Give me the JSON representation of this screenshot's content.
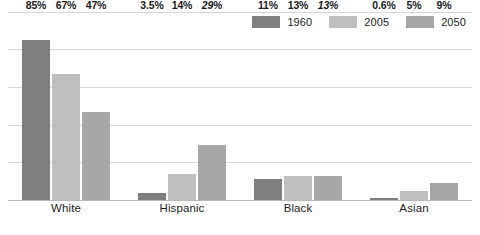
{
  "chart_data": {
    "type": "bar",
    "title": "",
    "subtitle": "",
    "xlabel": "",
    "ylabel": "",
    "ylim": [
      0,
      100
    ],
    "grid": true,
    "gridlines": [
      0,
      20,
      40,
      60,
      80,
      100
    ],
    "legend_position": "top-right",
    "categories": [
      "White",
      "Hispanic",
      "Black",
      "Asian"
    ],
    "series": [
      {
        "name": "1960",
        "color": "#7f7f7f",
        "values": [
          85,
          3.5,
          11,
          0.6
        ],
        "labels": [
          "85%",
          "3.5%",
          "11%",
          "0.6%"
        ]
      },
      {
        "name": "2005",
        "color": "#bfbfbf",
        "values": [
          67,
          14,
          13,
          5
        ],
        "labels": [
          "67%",
          "14%",
          "13%",
          "5%"
        ]
      },
      {
        "name": "2050",
        "color": "#a6a6a6",
        "values": [
          47,
          29,
          13,
          9
        ],
        "labels": [
          "47%",
          "29%",
          "13%",
          "9%"
        ]
      }
    ],
    "label_styles": {
      "White": [
        "normal",
        "normal",
        "normal"
      ],
      "Hispanic": [
        "normal",
        "normal",
        "italic"
      ],
      "Black": [
        "normal",
        "normal",
        "italic"
      ],
      "Asian": [
        "normal",
        "normal",
        "normal"
      ]
    }
  },
  "legend": {
    "items": [
      {
        "label": "1960",
        "color": "#7f7f7f"
      },
      {
        "label": "2005",
        "color": "#bfbfbf"
      },
      {
        "label": "2050",
        "color": "#a6a6a6"
      }
    ]
  },
  "colors": {
    "grid": "#d8d8d8",
    "baseline": "#b9b9b9",
    "text": "#231f20",
    "label_text": "#1a1a1a",
    "background": "#ffffff"
  }
}
